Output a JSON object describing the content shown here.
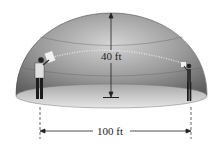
{
  "diagram": {
    "height_label": "40 ft",
    "width_label": "100 ft",
    "figures": [
      "person-left-speaking",
      "person-right-listening"
    ],
    "colors": {
      "dome_dark": "#6f6f6f",
      "dome_light": "#c8c8c8",
      "floor": "#d9d9d9",
      "line": "#222222"
    }
  }
}
